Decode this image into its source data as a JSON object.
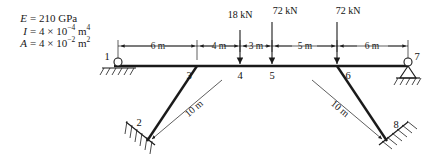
{
  "properties": {
    "modulus": {
      "symbol": "E",
      "equals": "=",
      "value": "210 GPa"
    },
    "inertia": {
      "symbol": "I",
      "equals": "=",
      "mantissa": "4",
      "times": "×",
      "base": "10",
      "exponent": "−4",
      "unit": "m",
      "unit_exponent": "4"
    },
    "area": {
      "symbol": "A",
      "equals": "=",
      "mantissa": "4",
      "times": "×",
      "base": "10",
      "exponent": "−2",
      "unit": "m",
      "unit_exponent": "2"
    }
  },
  "loads": [
    {
      "label": "18 kN",
      "at_node": "4",
      "magnitude": 18,
      "unit": "kN",
      "direction": "down"
    },
    {
      "label": "72 kN",
      "at_node": "5",
      "magnitude": 72,
      "unit": "kN",
      "direction": "down"
    },
    {
      "label": "72 kN",
      "at_node": "6",
      "magnitude": 72,
      "unit": "kN",
      "direction": "down"
    }
  ],
  "dimensions": [
    {
      "label": "6 m",
      "value": 6,
      "unit": "m",
      "from": "1",
      "to": "3"
    },
    {
      "label": "4 m",
      "value": 4,
      "unit": "m",
      "from": "3",
      "to": "4"
    },
    {
      "label": "3 m",
      "value": 3,
      "unit": "m",
      "from": "4",
      "to": "5"
    },
    {
      "label": "5 m",
      "value": 5,
      "unit": "m",
      "from": "5",
      "to": "6"
    },
    {
      "label": "6 m",
      "value": 6,
      "unit": "m",
      "from": "6",
      "to": "7"
    }
  ],
  "member_labels": [
    {
      "label": "10 m",
      "value": 10,
      "unit": "m",
      "from": "2",
      "to": "3"
    },
    {
      "label": "10 m",
      "value": 10,
      "unit": "m",
      "from": "6",
      "to": "8"
    }
  ],
  "nodes": [
    {
      "id": "1",
      "label": "1",
      "support": "roller"
    },
    {
      "id": "2",
      "label": "2",
      "support": "fixed-inclined"
    },
    {
      "id": "3",
      "label": "3",
      "support": "none"
    },
    {
      "id": "4",
      "label": "4",
      "support": "none"
    },
    {
      "id": "5",
      "label": "5",
      "support": "none"
    },
    {
      "id": "6",
      "label": "6",
      "support": "none"
    },
    {
      "id": "7",
      "label": "7",
      "support": "pin"
    },
    {
      "id": "8",
      "label": "8",
      "support": "fixed-inclined"
    }
  ]
}
